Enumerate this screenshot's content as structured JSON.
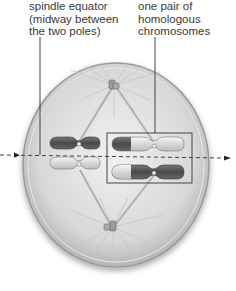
{
  "labels": {
    "spindle_equator": {
      "lines": [
        "spindle equator",
        "(midway between",
        "the two poles)"
      ]
    },
    "homologous_pair": {
      "lines": [
        "one pair of",
        "homologous",
        "chromosomes"
      ]
    }
  },
  "colors": {
    "background": "#ffffff",
    "cell_fill": "#d6d6d6",
    "cell_rim": "#9a9a9a",
    "chromosome_dark": "#5a5a5a",
    "chromosome_light": "#e8e8e8",
    "leader_line": "#333333",
    "equator_dash": "#444444"
  },
  "diagram": {
    "type": "metaphase-I cell",
    "poles": 2,
    "homologous_pairs_shown": 2,
    "highlighted_pair": "right pair (boxed)"
  }
}
